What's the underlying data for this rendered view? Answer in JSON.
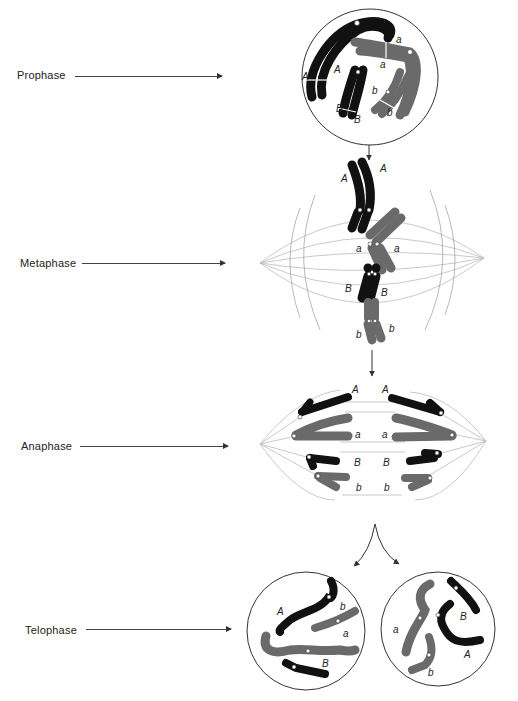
{
  "figure": {
    "phases": [
      {
        "label": "Prophase"
      },
      {
        "label": "Metaphase"
      },
      {
        "label": "Anaphase"
      },
      {
        "label": "Telophase"
      }
    ],
    "alleles": {
      "A": "A",
      "a": "a",
      "B": "B",
      "b": "b"
    },
    "colors": {
      "dark_chromosome": "#111111",
      "grey_chromosome": "#6a6a6a",
      "cell_outline": "#333333",
      "spindle": "#bbbbbb"
    }
  }
}
